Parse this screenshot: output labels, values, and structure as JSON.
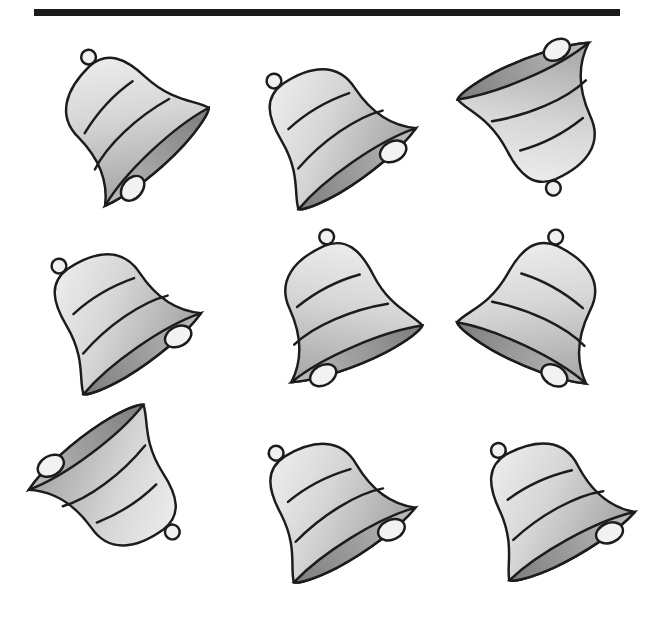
{
  "colors": {
    "bar": "#1a1a1a",
    "stroke": "#1c1c1c",
    "light": "#f2f2f2",
    "mid": "#c8c8c8",
    "dark": "#8e8e8e"
  },
  "bells": [
    {
      "id": 1,
      "row": 1,
      "col": 1,
      "rotate": -50,
      "mirror": true
    },
    {
      "id": 2,
      "row": 1,
      "col": 2,
      "rotate": -28,
      "mirror": false
    },
    {
      "id": 3,
      "row": 1,
      "col": 3,
      "rotate": 150,
      "mirror": true
    },
    {
      "id": 4,
      "row": 2,
      "col": 1,
      "rotate": -28,
      "mirror": false
    },
    {
      "id": 5,
      "row": 2,
      "col": 2,
      "rotate": -30,
      "mirror": true
    },
    {
      "id": 6,
      "row": 2,
      "col": 3,
      "rotate": 32,
      "mirror": false
    },
    {
      "id": 7,
      "row": 3,
      "col": 1,
      "rotate": 150,
      "mirror": false
    },
    {
      "id": 8,
      "row": 3,
      "col": 2,
      "rotate": -25,
      "mirror": false
    },
    {
      "id": 9,
      "row": 3,
      "col": 3,
      "rotate": -22,
      "mirror": false
    }
  ]
}
